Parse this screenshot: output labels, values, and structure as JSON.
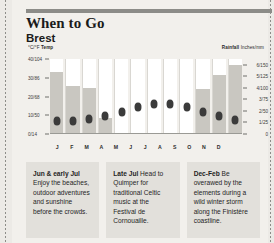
{
  "header": {
    "title": "When to Go",
    "subtitle": "Brest"
  },
  "chart_data": {
    "type": "bar",
    "title": "Brest",
    "categories": [
      "J",
      "F",
      "M",
      "A",
      "M",
      "J",
      "J",
      "A",
      "S",
      "O",
      "N",
      "D"
    ],
    "left_axis": {
      "label_prefix": "°C/°F",
      "label_bold": "Temp",
      "ticks": [
        "40/104",
        "30/86",
        "20/68",
        "10/50",
        "0/14"
      ],
      "values": [
        40,
        30,
        20,
        10,
        0
      ],
      "ylim": [
        0,
        40
      ]
    },
    "right_axis": {
      "label_bold": "Rainfall",
      "label_suffix": "Inches/mm",
      "ticks": [
        "6/150",
        "5/125",
        "4/100",
        "3/75",
        "2/50",
        "1/25",
        "0"
      ],
      "values": [
        6,
        5,
        4,
        3,
        2,
        1,
        0
      ],
      "ylim": [
        0,
        6.5
      ]
    },
    "series": [
      {
        "name": "Rainfall",
        "type": "bar",
        "unit": "inches",
        "values": [
          5.4,
          4.2,
          4.0,
          1.4,
          0.0,
          0.0,
          0.0,
          0.0,
          0.0,
          3.9,
          5.1,
          6.0
        ]
      },
      {
        "name": "Temp",
        "type": "scatter",
        "unit": "celsius",
        "values": [
          7.0,
          7.0,
          8.0,
          9.5,
          12.0,
          14.5,
          16.0,
          16.0,
          14.5,
          12.0,
          9.5,
          7.5
        ]
      }
    ],
    "grid": false,
    "legend": "none"
  },
  "notes": [
    {
      "id": "note-jun-early-jul",
      "lead": "Jun & early Jul",
      "body": " Enjoy the beaches, outdoor adventures and sunshine before the crowds."
    },
    {
      "id": "note-late-jul",
      "lead": "Late Jul",
      "body": " Head to Quimper for traditional Celtic music at the Festival de Cornouaille."
    },
    {
      "id": "note-dec-feb",
      "lead": "Dec-Feb",
      "body": " Be overawed by the elements during a wild winter storm along the Finis­tère coastline."
    }
  ]
}
